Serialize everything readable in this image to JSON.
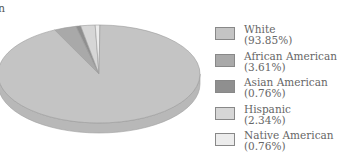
{
  "title_fragment": "n",
  "chart_data": {
    "type": "pie",
    "style": "3d",
    "title": "",
    "categories": [
      "White",
      "African American",
      "Asian American",
      "Hispanic",
      "Native American"
    ],
    "values": [
      93.85,
      3.61,
      0.76,
      2.34,
      0.76
    ],
    "labels": [
      "(93.85%)",
      "(3.61%)",
      "(0.76%)",
      "(2.34%)",
      "(0.76%)"
    ],
    "colors": [
      "#c4c4c4",
      "#a9a9a9",
      "#8f8f8f",
      "#d6d6d6",
      "#ececec"
    ],
    "legend_position": "right"
  },
  "legend": {
    "items": [
      {
        "label": "White",
        "value": "(93.85%)"
      },
      {
        "label": "African American",
        "value": "(3.61%)"
      },
      {
        "label": "Asian American",
        "value": "(0.76%)"
      },
      {
        "label": "Hispanic",
        "value": "(2.34%)"
      },
      {
        "label": "Native American",
        "value": "(0.76%)"
      }
    ]
  }
}
